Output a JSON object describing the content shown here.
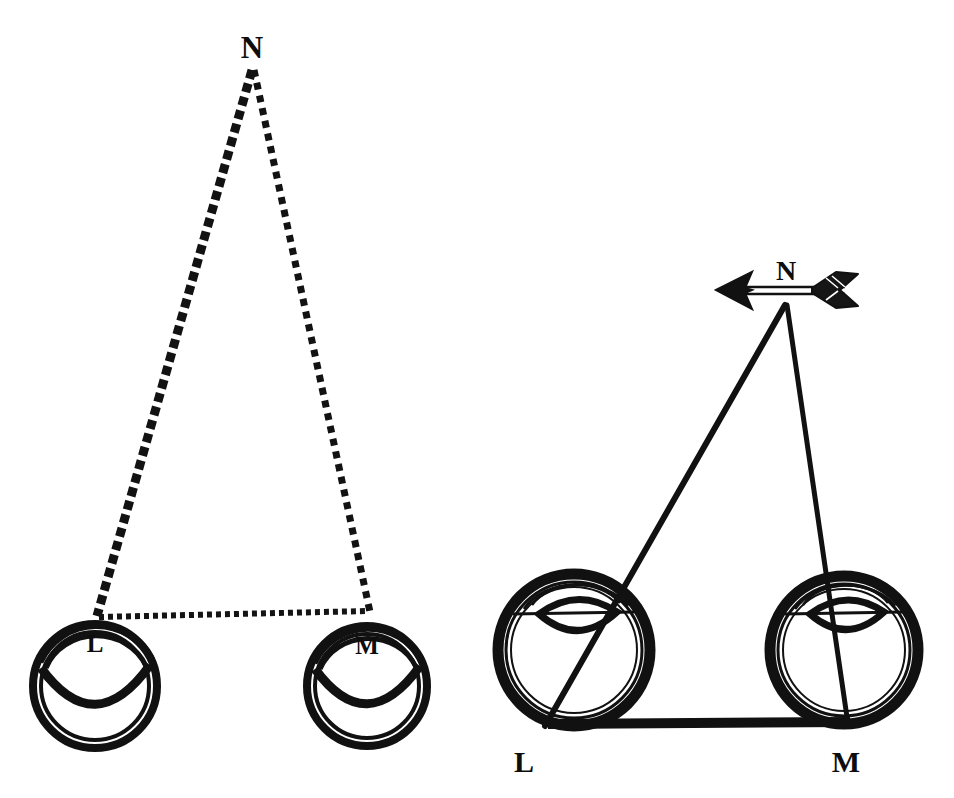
{
  "figure": {
    "background_color": "#ffffff",
    "ink_color": "#111111",
    "width": 954,
    "height": 798
  },
  "panels": [
    {
      "id": "left-panel",
      "name": "dashed-convergence-diagram",
      "line_style": "dashed",
      "apex": {
        "label": "N",
        "label_x": 252,
        "label_y": 52,
        "point_x": 252,
        "point_y": 68
      },
      "eyes": [
        {
          "label": "L",
          "side": "left",
          "center_x": 95,
          "center_y": 686,
          "radius": 62,
          "label_x": 95,
          "label_y": 643,
          "sight_x": 97,
          "sight_y": 618
        },
        {
          "label": "M",
          "side": "right",
          "center_x": 367,
          "center_y": 686,
          "radius": 59,
          "label_x": 367,
          "label_y": 645,
          "sight_x": 368,
          "sight_y": 620
        }
      ],
      "baseline": {
        "name": "interocular-baseline",
        "style": "dotted",
        "x1": 97,
        "y1": 616,
        "x2": 368,
        "y2": 612
      }
    },
    {
      "id": "right-panel",
      "name": "solid-convergence-diagram",
      "line_style": "solid",
      "apex": {
        "label": "N",
        "label_x": 786,
        "label_y": 272,
        "point_x": 786,
        "point_y": 304
      },
      "arrow": {
        "name": "arrow-object",
        "direction": "left",
        "shaft_x1": 738,
        "shaft_x2": 842,
        "shaft_y": 290,
        "head_x": 718,
        "fletch_x": 852
      },
      "eyes": [
        {
          "label": "L",
          "side": "left",
          "center_x": 574,
          "center_y": 652,
          "radius": 76,
          "label_x": 524,
          "label_y": 763,
          "sight_x": 544,
          "sight_y": 724
        },
        {
          "label": "M",
          "side": "right",
          "center_x": 844,
          "center_y": 652,
          "radius": 74,
          "label_x": 846,
          "label_y": 763,
          "sight_x": 848,
          "sight_y": 722
        }
      ],
      "baseline": {
        "name": "interocular-baseline",
        "style": "solid-thick",
        "x1": 546,
        "y1": 724,
        "x2": 848,
        "y2": 722
      }
    }
  ],
  "labels": {
    "apex_left": "N",
    "apex_right": "N",
    "eye_left_1": "L",
    "eye_right_1": "M",
    "eye_left_2": "L",
    "eye_right_2": "M"
  }
}
